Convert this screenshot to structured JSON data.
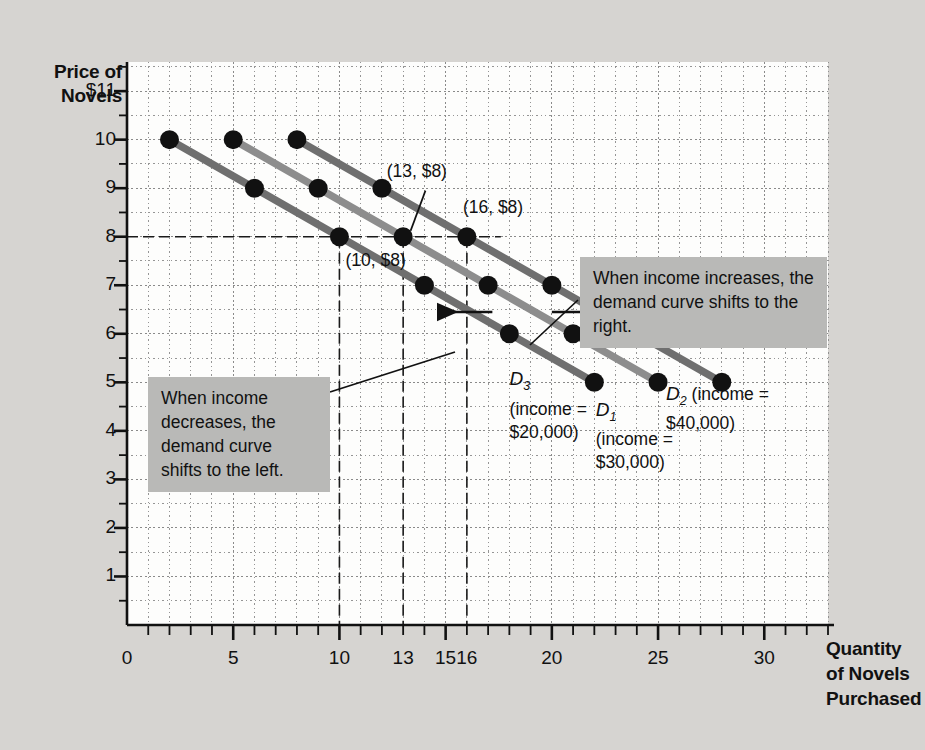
{
  "figure": {
    "y_axis_title": "Price of\nNovels",
    "x_axis_title": "Quantity\nof Novels\nPurchased"
  },
  "annotations": {
    "increase_box": "When income increases, the\ndemand curve shifts to\nthe right.",
    "decrease_box": "When income\ndecreases, the\ndemand curve\nshifts to the left."
  },
  "point_labels": [
    {
      "text": "(10, $8)",
      "x": 10,
      "y": 8
    },
    {
      "text": "(13, $8)",
      "x": 13,
      "y": 8
    },
    {
      "text": "(16, $8)",
      "x": 16,
      "y": 8
    }
  ],
  "chart_data": {
    "type": "line",
    "title": "",
    "xlabel": "Quantity of Novels Purchased",
    "ylabel": "Price of Novels",
    "xlim": [
      0,
      33
    ],
    "ylim": [
      0,
      11.6
    ],
    "grid": true,
    "legend": "inline-curve-labels",
    "x_ticks": [
      0,
      5,
      10,
      13,
      15,
      16,
      20,
      25,
      30
    ],
    "x_tick_labels": [
      "0",
      "5",
      "10",
      "13",
      "15",
      "16",
      "20",
      "25",
      "30"
    ],
    "y_ticks": [
      1,
      2,
      3,
      4,
      5,
      6,
      7,
      8,
      9,
      10,
      11
    ],
    "y_tick_labels": [
      "1",
      "2",
      "3",
      "4",
      "5",
      "6",
      "7",
      "8",
      "9",
      "10",
      "$11"
    ],
    "reference_lines": {
      "horizontal": [
        8
      ],
      "vertical": [
        10,
        13,
        16
      ]
    },
    "series": [
      {
        "name": "D3",
        "label_name": "D",
        "label_sub": "3",
        "label_income": "(income =\n$20,000)",
        "color": "#6f6f6f",
        "points": [
          {
            "x": 2,
            "y": 10
          },
          {
            "x": 6,
            "y": 9
          },
          {
            "x": 10,
            "y": 8
          },
          {
            "x": 14,
            "y": 7
          },
          {
            "x": 18,
            "y": 6
          },
          {
            "x": 22,
            "y": 5
          }
        ]
      },
      {
        "name": "D1",
        "label_name": "D",
        "label_sub": "1",
        "label_income": "(income =\n$30,000)",
        "color": "#8d8d8d",
        "points": [
          {
            "x": 5,
            "y": 10
          },
          {
            "x": 9,
            "y": 9
          },
          {
            "x": 13,
            "y": 8
          },
          {
            "x": 17,
            "y": 7
          },
          {
            "x": 21,
            "y": 6
          },
          {
            "x": 25,
            "y": 5
          }
        ]
      },
      {
        "name": "D2",
        "label_name": "D",
        "label_sub": "2",
        "label_income": "(income =\n$40,000)",
        "color": "#6f6f6f",
        "points": [
          {
            "x": 8,
            "y": 10
          },
          {
            "x": 12,
            "y": 9
          },
          {
            "x": 16,
            "y": 8
          },
          {
            "x": 20,
            "y": 7
          },
          {
            "x": 24,
            "y": 6
          },
          {
            "x": 28,
            "y": 5
          }
        ]
      }
    ],
    "shift_arrows": [
      {
        "direction": "left",
        "y": 6.45,
        "x_from": 17.2,
        "x_to": 14.8
      },
      {
        "direction": "right",
        "y": 6.45,
        "x_from": 20.0,
        "x_to": 22.4
      }
    ]
  }
}
